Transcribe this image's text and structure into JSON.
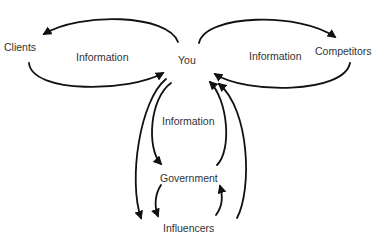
{
  "diagram": {
    "type": "flow",
    "colors": {
      "stroke": "#111111",
      "text": "#333333",
      "background": "#ffffff"
    },
    "nodes": {
      "clients": {
        "label": "Clients"
      },
      "you": {
        "label": "You"
      },
      "competitors": {
        "label": "Competitors"
      },
      "government": {
        "label": "Government"
      },
      "influencers": {
        "label": "Influencers"
      }
    },
    "edge_labels": {
      "left_loop": "Information",
      "right_loop": "Information",
      "vertical_flow": "Information"
    },
    "edges": [
      {
        "from": "You",
        "to": "Clients"
      },
      {
        "from": "Clients",
        "to": "You"
      },
      {
        "from": "You",
        "to": "Competitors"
      },
      {
        "from": "Competitors",
        "to": "You"
      },
      {
        "from": "You",
        "to": "Government"
      },
      {
        "from": "You",
        "to": "Influencers"
      },
      {
        "from": "Government",
        "to": "You"
      },
      {
        "from": "Influencers",
        "to": "You"
      },
      {
        "from": "Government",
        "to": "Influencers"
      },
      {
        "from": "Influencers",
        "to": "Government"
      }
    ]
  }
}
